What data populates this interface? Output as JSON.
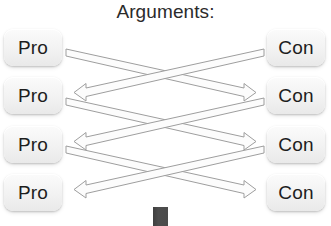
{
  "diagram": {
    "title": "Arguments:",
    "left_column": {
      "name": "pro-column",
      "items": [
        {
          "label": "Pro"
        },
        {
          "label": "Pro"
        },
        {
          "label": "Pro"
        },
        {
          "label": "Pro"
        }
      ]
    },
    "right_column": {
      "name": "con-column",
      "items": [
        {
          "label": "Con"
        },
        {
          "label": "Con"
        },
        {
          "label": "Con"
        },
        {
          "label": "Con"
        }
      ]
    },
    "connectors": {
      "style": "double-headed-block-arrow",
      "pattern": "crossing-x",
      "count": 6,
      "groups": [
        {
          "from": "pro-1",
          "to": "con-2"
        },
        {
          "from": "con-1",
          "to": "pro-2"
        },
        {
          "from": "pro-2",
          "to": "con-3"
        },
        {
          "from": "con-2",
          "to": "pro-3"
        },
        {
          "from": "pro-3",
          "to": "con-4"
        },
        {
          "from": "con-3",
          "to": "pro-4"
        }
      ]
    },
    "colors": {
      "background": "#ffffff",
      "box_fill": "#f2f2f2",
      "text": "#1d1d1d",
      "arrow_stroke": "#9a9a9a",
      "arrow_fill": "#fdfdfd",
      "bottom_block": "#474747"
    },
    "bottom_marker": {
      "name": "bottom-block-marker",
      "shape": "rectangle"
    }
  }
}
